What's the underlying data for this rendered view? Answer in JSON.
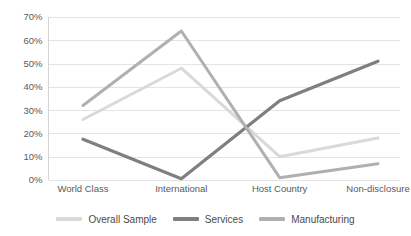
{
  "chart_data": {
    "type": "line",
    "title": "",
    "subtitle": "",
    "xlabel": "",
    "ylabel": "",
    "categories": [
      "World Class",
      "International",
      "Host Country",
      "Non-disclosure"
    ],
    "ylim": [
      0,
      70
    ],
    "ytick_values": [
      0,
      10,
      20,
      30,
      40,
      50,
      60,
      70
    ],
    "ytick_labels": [
      "0%",
      "10%",
      "20%",
      "30%",
      "40%",
      "50%",
      "60%",
      "70%"
    ],
    "ytick_suffix": "%",
    "grid": true,
    "grid_axis": "y",
    "legend_position": "bottom",
    "series": [
      {
        "name": "Overall Sample",
        "color": "#d9d9d9",
        "stroke_width": 3,
        "values": [
          26,
          48,
          10,
          18
        ]
      },
      {
        "name": "Services",
        "color": "#7f7f7f",
        "stroke_width": 3.2,
        "values": [
          17.5,
          0.5,
          34,
          51
        ]
      },
      {
        "name": "Manufacturing",
        "color": "#b0b0b0",
        "stroke_width": 3,
        "values": [
          32,
          64,
          1,
          7
        ]
      }
    ]
  },
  "axes": {
    "y_axis_name": "percentage-axis",
    "x_axis_name": "category-axis"
  },
  "colors": {
    "gridline": "#e4e4e4",
    "axis": "#d4d4d4",
    "tick_text": "#5a5a5a",
    "legend_text": "#4a4a4a",
    "background": "#ffffff"
  }
}
